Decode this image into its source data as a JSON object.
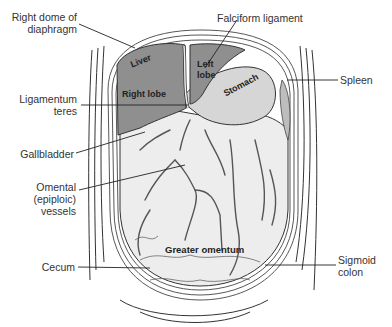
{
  "diagram": {
    "colors": {
      "liver": "#8f8f8f",
      "stomach": "#d6d6d6",
      "omentum": "#ededed",
      "outline": "#333333"
    },
    "labels_left": [
      {
        "id": "right-dome-diaphragm",
        "line1": "Right dome of",
        "line2": "diaphragm"
      },
      {
        "id": "ligamentum-teres",
        "line1": "Ligamentum",
        "line2": "teres"
      },
      {
        "id": "gallbladder",
        "line1": "Gallbladder"
      },
      {
        "id": "omental-vessels",
        "line1": "Omental",
        "line2": "(epiploic)",
        "line3": "vessels"
      },
      {
        "id": "cecum",
        "line1": "Cecum"
      }
    ],
    "labels_right": [
      {
        "id": "falciform-ligament",
        "line1": "Falciform ligament"
      },
      {
        "id": "spleen",
        "line1": "Spleen"
      },
      {
        "id": "sigmoid-colon",
        "line1": "Sigmoid",
        "line2": "colon"
      }
    ],
    "organ_labels": {
      "liver": "Liver",
      "right_lobe": "Right lobe",
      "left_lobe_1": "Left",
      "left_lobe_2": "lobe",
      "stomach": "Stomach",
      "greater_omentum": "Greater omentum"
    }
  }
}
